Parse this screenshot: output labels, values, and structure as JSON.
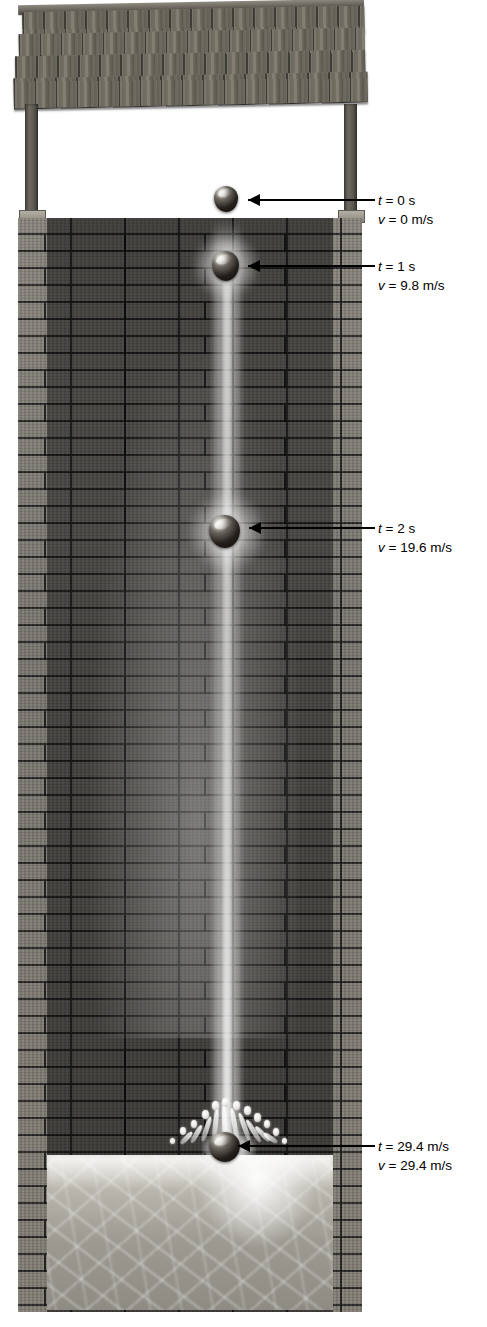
{
  "figure": {
    "background_color": "#ffffff",
    "annotation_color": "#000000"
  },
  "scene": {
    "roof": {
      "name": "wooden shingle roof",
      "shingle_rows": 4
    },
    "posts": {
      "name": "support posts",
      "count": 2
    },
    "wall": {
      "name": "brick wall",
      "color": "#6e6a63"
    },
    "water": {
      "name": "water pool",
      "color": "#b9b6ad"
    },
    "streak": {
      "name": "motion blur streak of falling ball"
    },
    "splash": {
      "name": "splash crown with droplets"
    }
  },
  "measurements": [
    {
      "id": "t0",
      "time_label": "t = 0 s",
      "velocity_label": "v = 0 m/s",
      "time_symbol": "t",
      "time_value": "= 0 s",
      "velocity_symbol": "v",
      "velocity_value": "= 0 m/s",
      "time_s": 0,
      "velocity_m_s": 0
    },
    {
      "id": "t1",
      "time_label": "t = 1 s",
      "velocity_label": "v = 9.8 m/s",
      "time_symbol": "t",
      "time_value": "= 1 s",
      "velocity_symbol": "v",
      "velocity_value": "= 9.8 m/s",
      "time_s": 1,
      "velocity_m_s": 9.8
    },
    {
      "id": "t2",
      "time_label": "t = 2 s",
      "velocity_label": "v = 19.6 m/s",
      "time_symbol": "t",
      "time_value": "= 2 s",
      "velocity_symbol": "v",
      "velocity_value": "= 19.6 m/s",
      "time_s": 2,
      "velocity_m_s": 19.6
    },
    {
      "id": "t3",
      "time_label": "t = 3 s",
      "velocity_label": "v = 29.4 m/s",
      "time_symbol": "t",
      "time_value": "= 29.4 m/s",
      "velocity_symbol": "v",
      "velocity_value": "= 29.4 m/s",
      "time_s": 3,
      "velocity_m_s": 29.4
    }
  ]
}
